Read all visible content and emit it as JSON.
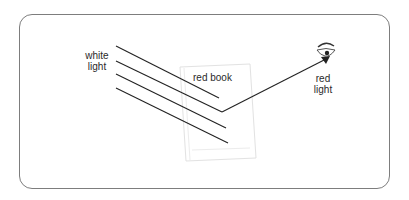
{
  "diagram": {
    "labels": {
      "incident": [
        "white",
        "light"
      ],
      "object": "red book",
      "reflected": [
        "red",
        "light"
      ]
    },
    "colors": {
      "line": "#222222",
      "frame": "#7d7d7d",
      "book_outline": "#e2e2e2"
    },
    "nodes": [
      {
        "id": "white-light-source",
        "label": "white light"
      },
      {
        "id": "red-book",
        "label": "red book"
      },
      {
        "id": "eye",
        "label": "red light"
      }
    ],
    "edges": [
      {
        "from": "white-light-source",
        "to": "red-book",
        "type": "incident ray",
        "count": 4
      },
      {
        "from": "red-book",
        "to": "eye",
        "type": "reflected ray",
        "label": "red light"
      }
    ]
  }
}
